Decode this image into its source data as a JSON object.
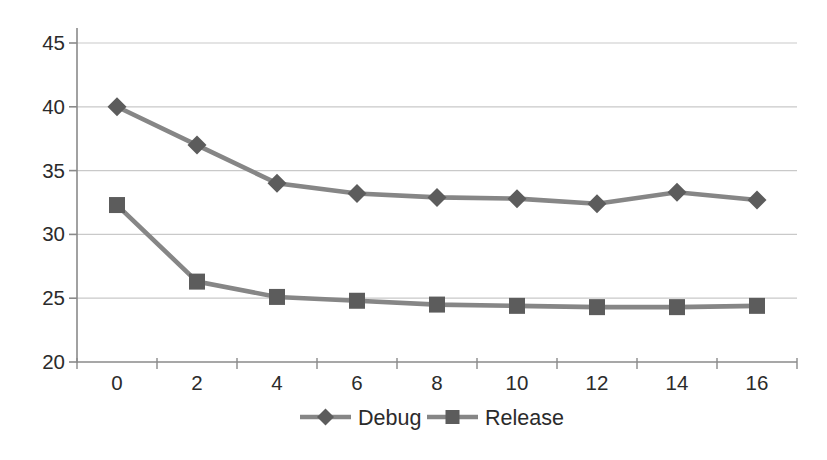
{
  "chart_data": {
    "type": "line",
    "title": "",
    "xlabel": "",
    "ylabel": "",
    "categories": [
      "0",
      "2",
      "4",
      "6",
      "8",
      "10",
      "12",
      "14",
      "16"
    ],
    "series": [
      {
        "name": "Debug",
        "marker": "diamond",
        "values": [
          40.0,
          37.0,
          34.0,
          33.2,
          32.9,
          32.8,
          32.4,
          33.3,
          32.7
        ]
      },
      {
        "name": "Release",
        "marker": "square",
        "values": [
          32.3,
          26.3,
          25.1,
          24.8,
          24.5,
          24.4,
          24.3,
          24.3,
          24.4
        ]
      }
    ],
    "ylim": [
      20,
      45
    ],
    "yticks": [
      20,
      25,
      30,
      35,
      40,
      45
    ],
    "grid": true,
    "legend_position": "bottom",
    "colors": {
      "line": "#868686",
      "marker": "#5c5c5c",
      "axis": "#8a8a8a",
      "gridline": "#c9c9c9",
      "text": "#2b2b2b",
      "background": "#ffffff"
    }
  }
}
